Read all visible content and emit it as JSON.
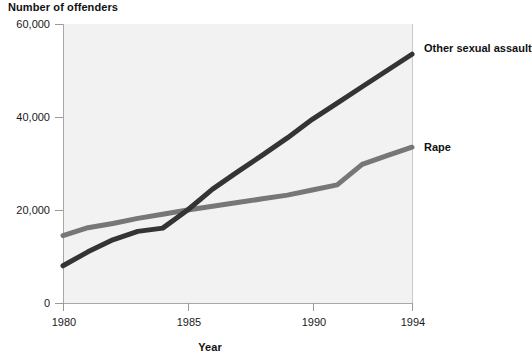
{
  "chart_data": {
    "type": "line",
    "title": "",
    "ylabel": "Number of offenders",
    "xlabel": "Year",
    "xlim": [
      1980,
      1994
    ],
    "ylim": [
      0,
      60000
    ],
    "grid": false,
    "legend_position": "right-inline-labels",
    "y_ticks": [
      "0",
      "20,000",
      "40,000",
      "60,000"
    ],
    "y_tick_values": [
      0,
      20000,
      40000,
      60000
    ],
    "x_ticks": [
      "1980",
      "1985",
      "1990",
      "1994"
    ],
    "x_tick_values": [
      1980,
      1985,
      1990,
      1994
    ],
    "x": [
      1980,
      1981,
      1982,
      1983,
      1984,
      1985,
      1986,
      1987,
      1988,
      1989,
      1990,
      1991,
      1992,
      1993,
      1994
    ],
    "series": [
      {
        "name": "Other sexual assault",
        "color": "#343434",
        "values": [
          8000,
          11000,
          13600,
          15400,
          16100,
          20000,
          24500,
          28200,
          31800,
          35500,
          39500,
          43000,
          46500,
          50000,
          53500
        ]
      },
      {
        "name": "Rape",
        "color": "#777777",
        "values": [
          14500,
          16200,
          17100,
          18200,
          19100,
          20000,
          20800,
          21600,
          22400,
          23200,
          24300,
          25400,
          29800,
          31700,
          33500
        ]
      }
    ]
  },
  "labels": {
    "y_axis_title": "Number of offenders",
    "x_axis_title": "Year",
    "series_other": "Other sexual assault",
    "series_rape": "Rape"
  },
  "ticks": {
    "y": [
      "60,000",
      "40,000",
      "20,000",
      "0"
    ],
    "x": [
      "1980",
      "1985",
      "1990",
      "1994"
    ]
  },
  "colors": {
    "series_other": "#343434",
    "series_rape": "#777777",
    "plot_background": "#f2f2f2",
    "axis": "#9a9a9a",
    "text": "#111111"
  }
}
